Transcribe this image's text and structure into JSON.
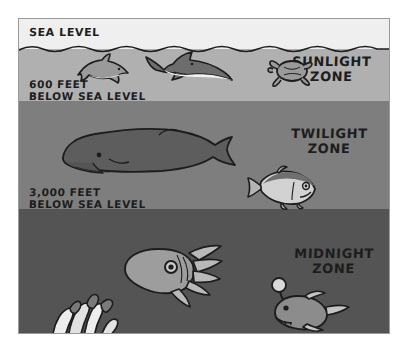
{
  "diagram": {
    "sea_level_label": "SEA LEVEL",
    "depth_markers": [
      {
        "name": "600-feet",
        "line1": "600 FEET",
        "line2": "BELOW SEA LEVEL"
      },
      {
        "name": "3000-feet",
        "line1": "3,000 FEET",
        "line2": "BELOW SEA LEVEL"
      }
    ],
    "zones": [
      {
        "name": "sunlight",
        "line1": "SUNLIGHT",
        "line2": "ZONE",
        "color": "#b0b0b0",
        "animals": [
          "dolphin",
          "shark",
          "sea-turtle"
        ]
      },
      {
        "name": "twilight",
        "line1": "TWILIGHT",
        "line2": "ZONE",
        "color": "#7e7e7e",
        "animals": [
          "sperm-whale",
          "hatchetfish"
        ]
      },
      {
        "name": "midnight",
        "line1": "MIDNIGHT",
        "line2": "ZONE",
        "color": "#545454",
        "animals": [
          "squid",
          "anglerfish",
          "tube-worms"
        ]
      }
    ],
    "colors": {
      "sky": "#efefef",
      "sunlight": "#b0b0b0",
      "twilight": "#7e7e7e",
      "midnight": "#545454",
      "outline": "#1d1d1d",
      "border": "#9a9a9a",
      "page_background": "#ffffff"
    }
  }
}
